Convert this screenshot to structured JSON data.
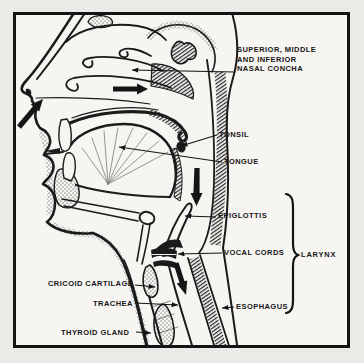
{
  "figure": {
    "labels": {
      "nasal_concha": {
        "lines": [
          "SUPERIOR, MIDDLE",
          "AND INFERIOR",
          "NASAL CONCHA"
        ]
      },
      "tonsil": "TONSIL",
      "tongue": "TONGUE",
      "epiglottis": "EPIGLOTTIS",
      "vocal_cords": "VOCAL CORDS",
      "larynx": "LARYNX",
      "cricoid_cartilage": "CRICOID CARTILAGE",
      "trachea": "TRACHEA",
      "thyroid_gland": "THYROID GLAND",
      "esophagus": "ESOPHAGUS"
    },
    "colors": {
      "ink": "#1b1b1b",
      "paper": "#f6f5f2",
      "margin": "#eceae7"
    }
  }
}
